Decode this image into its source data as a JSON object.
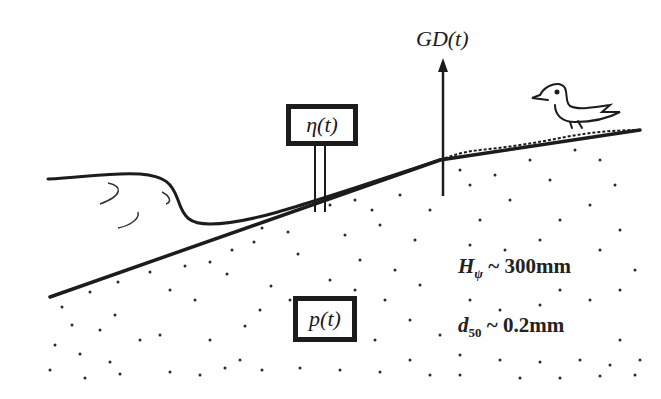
{
  "diagram": {
    "labels": {
      "ground_displacement": "GD(t)",
      "water_level_sensor": "η(t)",
      "pressure_sensor": "p(t)"
    },
    "parameters": {
      "wave_height": {
        "symbol": "H",
        "subscript": "ψ",
        "relation": "~",
        "value": "300mm"
      },
      "grain_size": {
        "symbol": "d",
        "subscript": "50",
        "relation": "~",
        "value": "0.2mm"
      }
    },
    "elements": [
      "wave-breaking",
      "beach-slope",
      "sand-bed",
      "water-level-gauge",
      "ground-displacement-arrow",
      "pressure-sensor",
      "bird"
    ],
    "colors": {
      "ink": "#1c1c1c",
      "background": "#ffffff"
    }
  }
}
